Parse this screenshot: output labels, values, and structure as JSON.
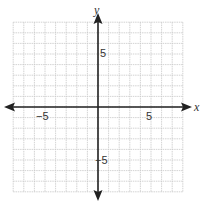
{
  "chart_data": {
    "type": "coordinate-grid",
    "title": "",
    "xlabel": "x",
    "ylabel": "y",
    "xlim": [
      -8,
      8
    ],
    "ylim": [
      -8,
      8
    ],
    "grid": true,
    "grid_step": 1,
    "tick_labels": {
      "x": [
        {
          "value": -5,
          "label": "−5"
        },
        {
          "value": 5,
          "label": "5"
        }
      ],
      "y": [
        {
          "value": 5,
          "label": "5"
        },
        {
          "value": -5,
          "label": "−5"
        }
      ]
    },
    "arrows_on_axes": true,
    "data_points": []
  },
  "labels": {
    "x_axis": "x",
    "y_axis": "y",
    "x_neg5": "−5",
    "x_pos5": "5",
    "y_pos5": "5",
    "y_neg5": "−5"
  },
  "colors": {
    "grid": "#c8c8c8",
    "axis": "#222222"
  }
}
